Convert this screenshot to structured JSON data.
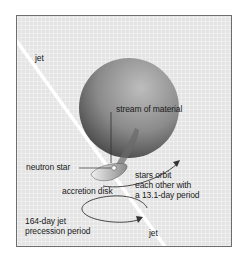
{
  "diagram": {
    "labels": {
      "jet_top": "jet",
      "jet_bottom": "jet",
      "stream": "stream of material",
      "neutron_star": "neutron star",
      "accretion_disk": "accretion disk",
      "orbit": "stars orbit\neach other with\na 13.1-day period",
      "precession": "164-day jet\nprecession period"
    },
    "colors": {
      "background": "#e4e4e4",
      "frame_border": "#6e6e6e",
      "jet": "#ffffff",
      "companion_star_light": "#a8a8a8",
      "companion_star_dark": "#4a4a4a",
      "line": "#333333"
    }
  }
}
